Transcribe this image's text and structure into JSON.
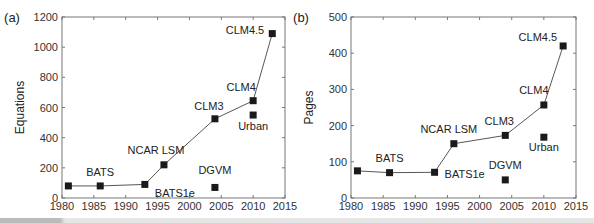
{
  "chart_data": [
    {
      "type": "line",
      "panel": "(a)",
      "title": "",
      "xlabel": "",
      "ylabel": "Equations",
      "xlim": [
        1980,
        2015
      ],
      "ylim": [
        0,
        1200
      ],
      "xticks": [
        1980,
        1985,
        1990,
        1995,
        2000,
        2005,
        2010,
        2015
      ],
      "yticks": [
        0,
        200,
        400,
        600,
        800,
        1000,
        1200
      ],
      "grid": false,
      "series": [
        {
          "name": "Main lineage",
          "connected": true,
          "points": [
            {
              "label": "",
              "x": 1981,
              "y": 80
            },
            {
              "label": "BATS",
              "x": 1986,
              "y": 80
            },
            {
              "label": "BATS1e",
              "x": 1993,
              "y": 90
            },
            {
              "label": "NCAR LSM",
              "x": 1996,
              "y": 220
            },
            {
              "label": "CLM3",
              "x": 2004,
              "y": 525
            },
            {
              "label": "CLM4",
              "x": 2010,
              "y": 645
            },
            {
              "label": "CLM4.5",
              "x": 2013,
              "y": 1090
            }
          ]
        },
        {
          "name": "Separate components",
          "connected": false,
          "points": [
            {
              "label": "DGVM",
              "x": 2004,
              "y": 70
            },
            {
              "label": "Urban",
              "x": 2010,
              "y": 550
            }
          ]
        }
      ]
    },
    {
      "type": "line",
      "panel": "(b)",
      "title": "",
      "xlabel": "",
      "ylabel": "Pages",
      "xlim": [
        1980,
        2015
      ],
      "ylim": [
        0,
        500
      ],
      "xticks": [
        1980,
        1985,
        1990,
        1995,
        2000,
        2005,
        2010,
        2015
      ],
      "yticks": [
        0,
        100,
        200,
        300,
        400,
        500
      ],
      "grid": false,
      "series": [
        {
          "name": "Main lineage",
          "connected": true,
          "points": [
            {
              "label": "",
              "x": 1981,
              "y": 75
            },
            {
              "label": "BATS",
              "x": 1986,
              "y": 70
            },
            {
              "label": "BATS1e",
              "x": 1993,
              "y": 71
            },
            {
              "label": "NCAR LSM",
              "x": 1996,
              "y": 150
            },
            {
              "label": "CLM3",
              "x": 2004,
              "y": 173
            },
            {
              "label": "CLM4",
              "x": 2010,
              "y": 257
            },
            {
              "label": "CLM4.5",
              "x": 2013,
              "y": 420
            }
          ]
        },
        {
          "name": "Separate components",
          "connected": false,
          "points": [
            {
              "label": "DGVM",
              "x": 2004,
              "y": 50
            },
            {
              "label": "Urban",
              "x": 2010,
              "y": 168
            }
          ]
        }
      ]
    }
  ],
  "panels": [
    {
      "id": "a",
      "box": {
        "left": 62,
        "right": 285,
        "top": 17,
        "bottom": 198
      },
      "label_offsets": {
        "BATS": [
          0,
          -10,
          "middle"
        ],
        "BATS1e": [
          10,
          13,
          "start"
        ],
        "NCAR LSM": [
          -8,
          -11,
          "middle"
        ],
        "CLM3": [
          -6,
          -9,
          "middle"
        ],
        "CLM4": [
          -12,
          -10,
          "middle"
        ],
        "CLM4.5": [
          -8,
          0,
          "end"
        ],
        "DGVM": [
          0,
          -13,
          "middle"
        ],
        "Urban": [
          0,
          15,
          "middle"
        ]
      }
    },
    {
      "id": "b",
      "box": {
        "left": 351,
        "right": 576,
        "top": 17,
        "bottom": 198
      },
      "label_offsets": {
        "BATS": [
          0,
          -11,
          "middle"
        ],
        "BATS1e": [
          10,
          6,
          "start"
        ],
        "NCAR LSM": [
          -5,
          -11,
          "middle"
        ],
        "CLM3": [
          -6,
          -10,
          "middle"
        ],
        "CLM4": [
          -10,
          -11,
          "middle"
        ],
        "CLM4.5": [
          -6,
          -5,
          "end"
        ],
        "DGVM": [
          0,
          -11,
          "middle"
        ],
        "Urban": [
          0,
          14,
          "middle"
        ]
      }
    }
  ]
}
